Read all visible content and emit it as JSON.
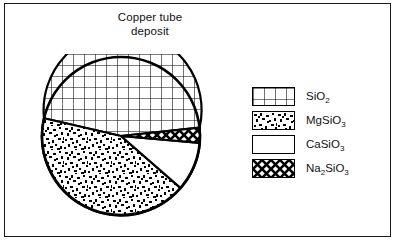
{
  "figure": {
    "title": "Copper tube\ndeposit",
    "background_color": "#ffffff",
    "line_color": "#000000",
    "frame": true
  },
  "legend": {
    "position": "right",
    "entries": [
      {
        "label_html": "SiO<sub>2</sub>",
        "label": "SiO2",
        "pattern": "grid-crosshatch",
        "swatch_name": "legend-swatch-sio2"
      },
      {
        "label_html": "MgSiO<sub>3</sub>",
        "label": "MgSiO3",
        "pattern": "speckle-stipple",
        "swatch_name": "legend-swatch-mgsio3"
      },
      {
        "label_html": "CaSiO<sub>3</sub>",
        "label": "CaSiO3",
        "pattern": "solid-white",
        "swatch_name": "legend-swatch-casio3"
      },
      {
        "label_html": "Na<sub>2</sub>SiO<sub>3</sub>",
        "label": "Na2SiO3",
        "pattern": "diagonal-crosshatch",
        "swatch_name": "legend-swatch-na2sio3"
      }
    ]
  },
  "chart_data": {
    "type": "pie",
    "title": "Copper tube deposit",
    "xlabel": "",
    "ylabel": "",
    "start_angle_deg": 6,
    "direction": "clockwise",
    "categories": [
      "SiO2",
      "MgSiO3",
      "CaSiO3",
      "Na2SiO3"
    ],
    "values": [
      50,
      33,
      12,
      5
    ],
    "units": "percent",
    "slices": [
      {
        "label": "SiO2",
        "value": 50,
        "pattern": "grid-crosshatch"
      },
      {
        "label": "MgSiO3",
        "value": 33,
        "pattern": "speckle-stipple"
      },
      {
        "label": "CaSiO3",
        "value": 12,
        "pattern": "solid-white"
      },
      {
        "label": "Na2SiO3",
        "value": 5,
        "pattern": "diagonal-crosshatch"
      }
    ],
    "legend_position": "right",
    "grid": false
  }
}
